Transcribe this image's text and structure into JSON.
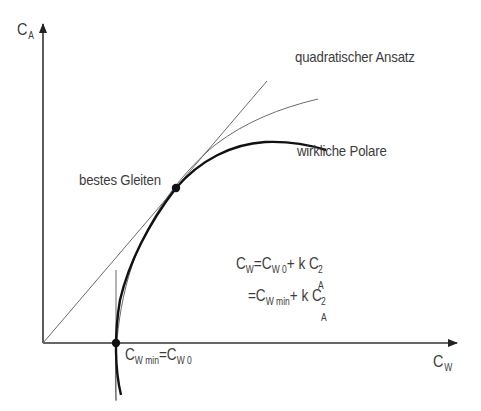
{
  "diagram": {
    "type": "drag-polar",
    "language": "de",
    "axes": {
      "y": {
        "symbol": "C",
        "subscript": "A"
      },
      "x": {
        "symbol": "C",
        "subscript": "W"
      }
    },
    "labels": {
      "quadratic": "quadratischer Ansatz",
      "real_polar": "wirkliche Polare",
      "best_glide": "bestes Gleiten"
    },
    "point_cwmin": {
      "lhs_symbol": "C",
      "lhs_sub": "W min",
      "eq": "=",
      "rhs_symbol": "C",
      "rhs_sub": "W 0"
    },
    "formula": {
      "line1": {
        "lhs": "C",
        "lhs_sub": "W",
        "eq": "=",
        "t1": "C",
        "t1_sub": "W 0",
        "plus": "+",
        "k": "k",
        "t2": "C",
        "t2_sub": "A",
        "t2_sup": "2"
      },
      "line2": {
        "eq": "=",
        "t1": "C",
        "t1_sub": "W min",
        "plus": "+",
        "k": "k",
        "t2": "C",
        "t2_sub": "A",
        "t2_sup": "2"
      }
    },
    "colors": {
      "axis": "#333333",
      "thin_line": "#6a6a6a",
      "polar": "#111111",
      "text": "#3c3c3c"
    }
  }
}
